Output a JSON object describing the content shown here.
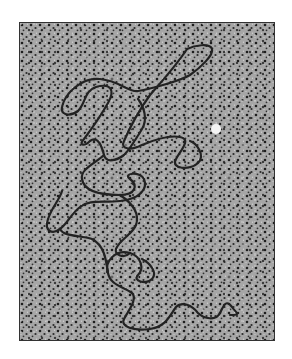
{
  "image": {
    "description": "Electron micrograph of a single long DNA-like strand on a granular dotted background",
    "colors": {
      "background": "#ffffff",
      "field": "#a8a8a8",
      "dots": "#1e1e1e",
      "highlights": "#d8d8d8",
      "strand": "#222222",
      "bead": "#f4f4f4",
      "border": "#333333"
    },
    "bead": {
      "cx": 215,
      "cy": 128,
      "r": 5
    }
  }
}
